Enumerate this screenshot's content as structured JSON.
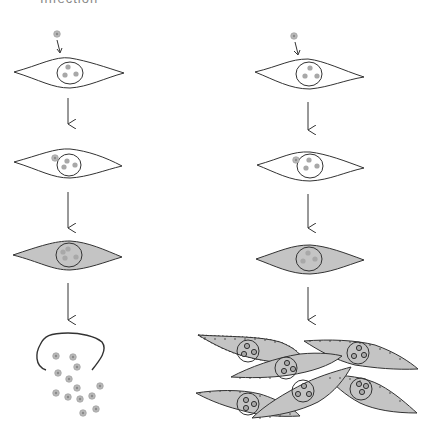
{
  "title": "Infection",
  "colors": {
    "stroke": "#333333",
    "cell_fill_infected": "#c4c4c4",
    "virus_fill": "#b8b8b8",
    "background": "#ffffff"
  },
  "pathways": [
    {
      "name": "lytic",
      "stages": [
        "virus-attachment",
        "virus-entry",
        "infected-cell",
        "cell-lysis-virion-release"
      ]
    },
    {
      "name": "transformation",
      "stages": [
        "virus-attachment",
        "virus-entry",
        "infected-cell",
        "transformed-cell-overgrowth"
      ]
    }
  ]
}
